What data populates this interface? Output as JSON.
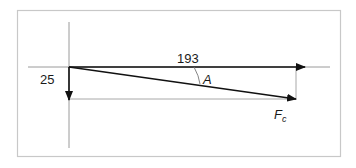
{
  "diagram": {
    "type": "vector-resolution",
    "labels": {
      "horizontal_component": "193",
      "vertical_component": "25",
      "angle": "A",
      "resultant": "F",
      "resultant_subscript": "c"
    },
    "colors": {
      "frame": "#c8c8c8",
      "axis": "#9a9a9a",
      "vector": "#111111",
      "guide": "#a8a8a8"
    }
  }
}
